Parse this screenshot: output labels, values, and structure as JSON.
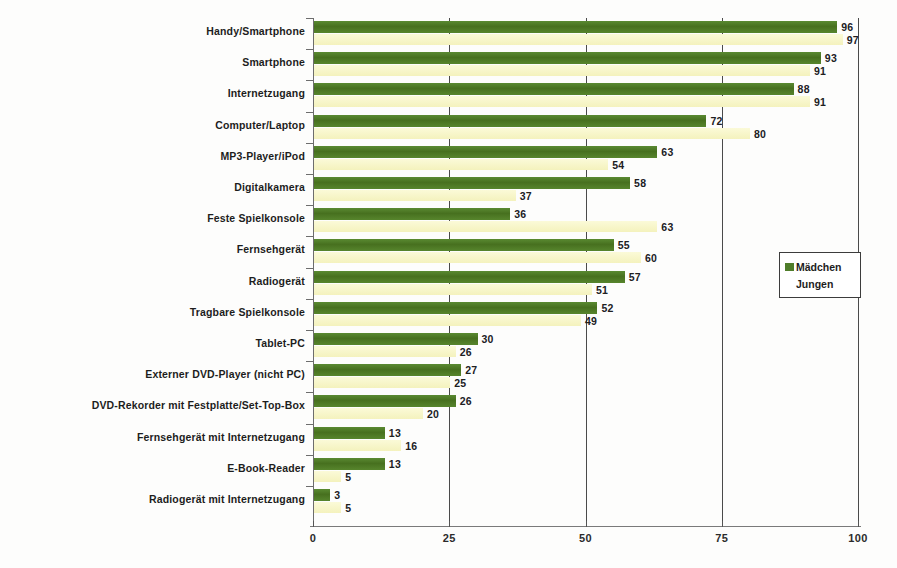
{
  "chart_data": {
    "type": "bar",
    "orientation": "horizontal",
    "title": "",
    "xlabel": "",
    "ylabel": "",
    "xlim": [
      0,
      100
    ],
    "xticks": [
      0,
      25,
      50,
      75,
      100
    ],
    "grid": true,
    "legend_position": "right",
    "categories": [
      "Handy/Smartphone",
      "Smartphone",
      "Internetzugang",
      "Computer/Laptop",
      "MP3-Player/iPod",
      "Digitalkamera",
      "Feste Spielkonsole",
      "Fernsehgerät",
      "Radiogerät",
      "Tragbare Spielkonsole",
      "Tablet-PC",
      "Externer DVD-Player (nicht PC)",
      "DVD-Rekorder mit Festplatte/Set-Top-Box",
      "Fernsehgerät mit Internetzugang",
      "E-Book-Reader",
      "Radiogerät mit Internetzugang"
    ],
    "series": [
      {
        "name": "Mädchen",
        "color": "#4f7d2a",
        "values": [
          96,
          93,
          88,
          72,
          63,
          58,
          36,
          55,
          57,
          52,
          30,
          27,
          26,
          13,
          13,
          3
        ]
      },
      {
        "name": "Jungen",
        "color": "#f8f7ca",
        "values": [
          97,
          91,
          91,
          80,
          54,
          37,
          63,
          60,
          51,
          49,
          26,
          25,
          20,
          16,
          5,
          5
        ]
      }
    ]
  },
  "legend": {
    "items": [
      {
        "label": "Mädchen"
      },
      {
        "label": "Jungen"
      }
    ]
  }
}
